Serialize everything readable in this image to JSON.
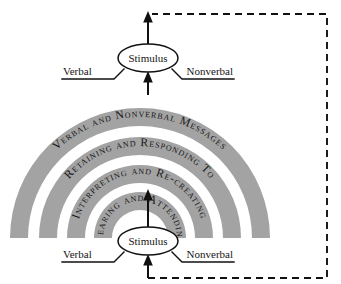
{
  "diagram": {
    "colors": {
      "band": "#a3a3a3",
      "background": "#ffffff",
      "ink": "#111111"
    },
    "rings": [
      {
        "id": "ring-outer",
        "label": "Verbal and Nonverbal Messages"
      },
      {
        "id": "ring-second",
        "label": "Retaining and Responding To"
      },
      {
        "id": "ring-third",
        "label": "Interpreting and Re-creating"
      },
      {
        "id": "ring-inner",
        "label": "Hearing and Attending"
      }
    ],
    "top_node": {
      "label": "Stimulus",
      "left_label": "Verbal",
      "right_label": "Nonverbal"
    },
    "bottom_node": {
      "label": "Stimulus",
      "left_label": "Verbal",
      "right_label": "Nonverbal"
    },
    "feedback": {
      "style": "dashed",
      "description": "Feedback loop from top output back to bottom input"
    }
  }
}
